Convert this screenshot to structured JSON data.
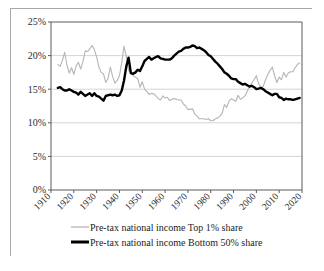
{
  "chart_data": {
    "type": "line",
    "title": "",
    "subtitle": "",
    "xlabel": "",
    "ylabel": "",
    "xlim": [
      1910,
      2020
    ],
    "ylim": [
      0,
      0.25
    ],
    "grid": true,
    "legend_position": "bottom",
    "y_tick_labels": [
      "0%",
      "5%",
      "10%",
      "15%",
      "20%",
      "25%"
    ],
    "y_tick_values": [
      0,
      5,
      10,
      15,
      20,
      25
    ],
    "x_tick_labels": [
      "1910",
      "1920",
      "1930",
      "1940",
      "1950",
      "1960",
      "1970",
      "1980",
      "1990",
      "2000",
      "2010",
      "2020"
    ],
    "x_tick_values": [
      1910,
      1920,
      1930,
      1940,
      1950,
      1960,
      1970,
      1980,
      1990,
      2000,
      2010,
      2020
    ],
    "colors": {
      "top1": "#b5b5b5",
      "bottom50": "#000000",
      "gridline": "#c9c9c9",
      "axis": "#5a5a5a",
      "border": "#a8a8a8",
      "background": "#ffffff"
    },
    "series": [
      {
        "name": "Pre-tax national income Top 1%  share",
        "legend_label": "Pre-tax national income Top 1%  share",
        "color": "#b5b5b5",
        "line_width": "thin",
        "x": [
          1913,
          1914,
          1915,
          1916,
          1917,
          1918,
          1919,
          1920,
          1921,
          1922,
          1923,
          1924,
          1925,
          1926,
          1927,
          1928,
          1929,
          1930,
          1931,
          1932,
          1933,
          1934,
          1935,
          1936,
          1937,
          1938,
          1939,
          1940,
          1941,
          1942,
          1943,
          1944,
          1945,
          1946,
          1947,
          1948,
          1949,
          1950,
          1951,
          1952,
          1953,
          1954,
          1955,
          1956,
          1957,
          1958,
          1959,
          1960,
          1961,
          1962,
          1963,
          1964,
          1965,
          1966,
          1967,
          1968,
          1969,
          1970,
          1971,
          1972,
          1973,
          1974,
          1975,
          1976,
          1977,
          1978,
          1979,
          1980,
          1981,
          1982,
          1983,
          1984,
          1985,
          1986,
          1987,
          1988,
          1989,
          1990,
          1991,
          1992,
          1993,
          1994,
          1995,
          1996,
          1997,
          1998,
          1999,
          2000,
          2001,
          2002,
          2003,
          2004,
          2005,
          2006,
          2007,
          2008,
          2009,
          2010,
          2011,
          2012,
          2013,
          2014,
          2015,
          2016,
          2017,
          2018,
          2019
        ],
        "values": [
          18.7,
          18.4,
          19.3,
          20.5,
          18.6,
          17.4,
          18.2,
          17.2,
          18.4,
          19.0,
          18.0,
          19.1,
          20.7,
          20.6,
          21.0,
          21.5,
          20.9,
          19.8,
          18.3,
          17.5,
          17.3,
          16.0,
          16.6,
          18.3,
          16.9,
          15.9,
          16.3,
          17.0,
          19.0,
          21.4,
          19.8,
          17.8,
          17.4,
          17.0,
          16.8,
          16.6,
          15.3,
          16.1,
          15.0,
          14.7,
          14.2,
          14.4,
          14.3,
          14.0,
          13.6,
          13.4,
          14.0,
          13.7,
          13.8,
          13.3,
          13.5,
          13.6,
          13.5,
          13.4,
          13.4,
          12.8,
          12.5,
          12.0,
          12.0,
          12.1,
          11.3,
          11.0,
          10.6,
          10.6,
          10.6,
          10.5,
          10.6,
          10.3,
          10.3,
          10.6,
          10.7,
          11.0,
          11.4,
          12.7,
          12.3,
          13.2,
          13.6,
          13.4,
          13.2,
          14.1,
          13.5,
          13.7,
          14.0,
          14.7,
          15.4,
          15.9,
          16.4,
          17.0,
          15.8,
          15.2,
          15.4,
          16.4,
          17.2,
          17.8,
          18.3,
          17.0,
          16.0,
          16.8,
          16.4,
          17.5,
          16.8,
          17.4,
          17.6,
          17.6,
          18.2,
          18.7,
          18.9
        ]
      },
      {
        "name": "Pre-tax national income Bottom 50% share",
        "legend_label": "Pre-tax national income Bottom 50% share",
        "color": "#000000",
        "line_width": "thick",
        "x": [
          1913,
          1914,
          1915,
          1916,
          1917,
          1918,
          1919,
          1920,
          1921,
          1922,
          1923,
          1924,
          1925,
          1926,
          1927,
          1928,
          1929,
          1930,
          1931,
          1932,
          1933,
          1934,
          1935,
          1936,
          1937,
          1938,
          1939,
          1940,
          1941,
          1942,
          1943,
          1944,
          1945,
          1946,
          1947,
          1948,
          1949,
          1950,
          1951,
          1952,
          1953,
          1954,
          1955,
          1956,
          1957,
          1958,
          1959,
          1960,
          1961,
          1962,
          1963,
          1964,
          1965,
          1966,
          1967,
          1968,
          1969,
          1970,
          1971,
          1972,
          1973,
          1974,
          1975,
          1976,
          1977,
          1978,
          1979,
          1980,
          1981,
          1982,
          1983,
          1984,
          1985,
          1986,
          1987,
          1988,
          1989,
          1990,
          1991,
          1992,
          1993,
          1994,
          1995,
          1996,
          1997,
          1998,
          1999,
          2000,
          2001,
          2002,
          2003,
          2004,
          2005,
          2006,
          2007,
          2008,
          2009,
          2010,
          2011,
          2012,
          2013,
          2014,
          2015,
          2016,
          2017,
          2018,
          2019
        ],
        "values": [
          15.2,
          15.3,
          15.0,
          14.8,
          14.8,
          15.0,
          14.8,
          14.6,
          14.5,
          14.2,
          14.6,
          14.3,
          14.0,
          14.2,
          14.4,
          14.0,
          14.4,
          14.0,
          13.9,
          13.6,
          13.3,
          14.0,
          14.1,
          14.2,
          14.1,
          14.2,
          14.0,
          14.1,
          14.8,
          16.3,
          18.4,
          19.7,
          17.4,
          17.3,
          17.5,
          17.9,
          17.7,
          18.4,
          19.2,
          19.5,
          19.8,
          19.4,
          19.6,
          19.8,
          19.9,
          19.6,
          19.5,
          19.4,
          19.4,
          19.4,
          19.6,
          20.0,
          20.3,
          20.6,
          20.7,
          21.0,
          21.2,
          21.2,
          21.3,
          21.5,
          21.4,
          21.1,
          21.2,
          21.0,
          20.8,
          20.5,
          20.1,
          19.9,
          19.5,
          19.1,
          18.8,
          18.4,
          18.0,
          17.5,
          17.3,
          17.0,
          16.6,
          16.5,
          16.5,
          16.1,
          15.9,
          15.7,
          15.8,
          15.6,
          15.4,
          15.5,
          15.3,
          15.0,
          15.1,
          15.2,
          15.0,
          14.7,
          14.5,
          14.3,
          14.1,
          14.3,
          14.3,
          13.8,
          13.7,
          13.4,
          13.6,
          13.5,
          13.5,
          13.4,
          13.5,
          13.6,
          13.7
        ]
      }
    ]
  },
  "legend": {
    "items": [
      {
        "label": "Pre-tax national income Top 1%  share",
        "style": "thin-gray"
      },
      {
        "label": "Pre-tax national income Bottom 50% share",
        "style": "thick-black"
      }
    ]
  }
}
